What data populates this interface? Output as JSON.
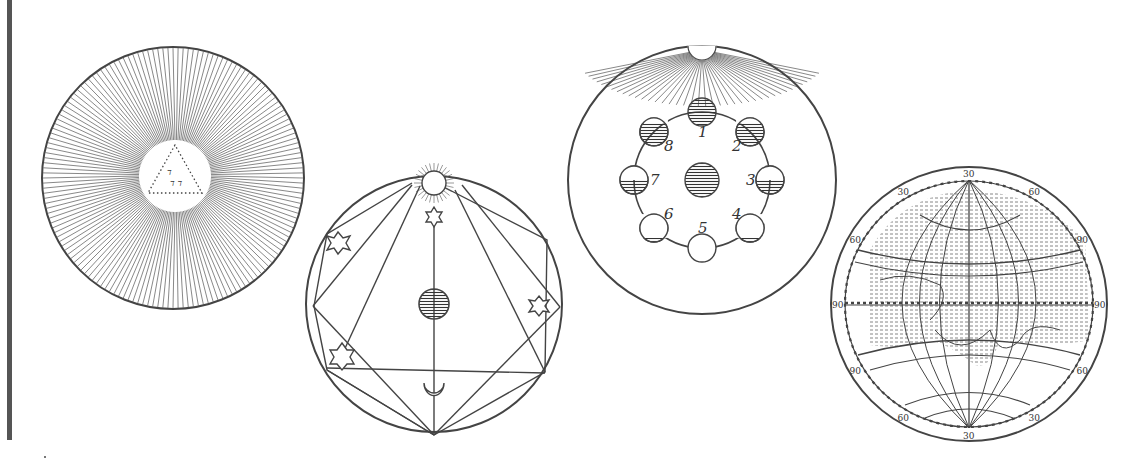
{
  "figures": [
    {
      "id": "radiant-sun",
      "description": "Circle filled with radial rays around a central white disc containing a dotted triangle with Hebrew letters"
    },
    {
      "id": "planetary-aspects",
      "description": "Circle with sun at top, stars, inscribed polygon lines, central dark globe and crescent moon"
    },
    {
      "id": "lunar-phases",
      "description": "Sun rays from top, central earth, eight moon phases on a ring",
      "phase_labels": [
        "1",
        "2",
        "3",
        "4",
        "5",
        "6",
        "7",
        "8"
      ]
    },
    {
      "id": "world-map-globe",
      "description": "Globe with graticule and continents; degree ring",
      "ring_labels": [
        "30",
        "60",
        "90",
        "90",
        "60",
        "30",
        "30",
        "60",
        "90",
        "90",
        "60",
        "30"
      ],
      "map_numbers": [
        "12",
        "14",
        "8",
        "17",
        "2",
        "4"
      ]
    }
  ],
  "colors": {
    "ink": "#333333",
    "paper": "#ffffff",
    "rule": "#555555"
  }
}
